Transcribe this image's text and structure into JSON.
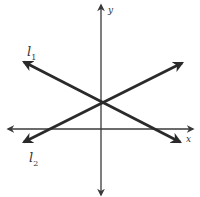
{
  "diagram": {
    "type": "coordinate-plane-intersecting-lines",
    "colors": {
      "line": "#2a2a2a",
      "axis": "#3a3a3a",
      "background": "#ffffff"
    },
    "axes": {
      "x": {
        "label": "x",
        "from": [
          8,
          129
        ],
        "to": [
          193,
          129
        ]
      },
      "y": {
        "label": "y",
        "from": [
          101,
          195
        ],
        "to": [
          101,
          5
        ]
      }
    },
    "lines": [
      {
        "name": "l1",
        "label_base": "l",
        "label_sub": "1",
        "from": [
          180,
          142
        ],
        "to": [
          24,
          62
        ]
      },
      {
        "name": "l2",
        "label_base": "l",
        "label_sub": "2",
        "from": [
          24,
          142
        ],
        "to": [
          182,
          63
        ]
      }
    ],
    "intersection": [
      101,
      102
    ]
  }
}
